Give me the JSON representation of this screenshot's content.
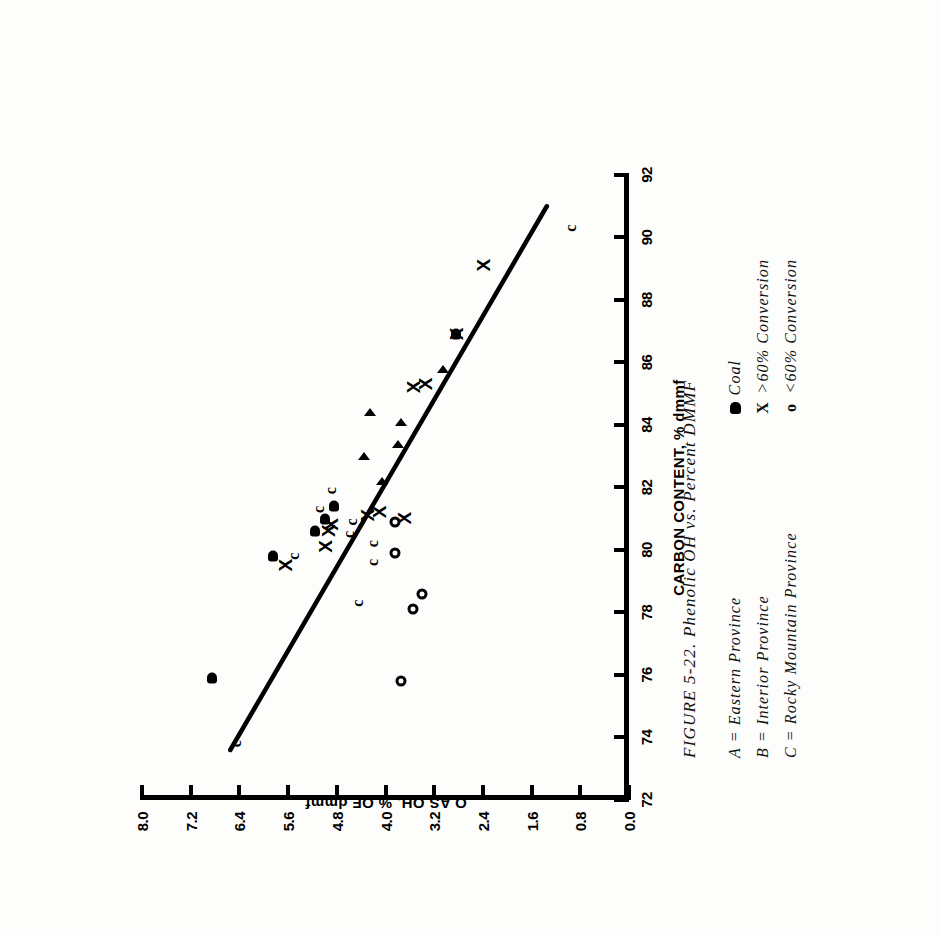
{
  "figure": {
    "caption": "FIGURE 5-22.  Phenolic OH vs. Percent DMMF"
  },
  "legend": {
    "provinces": [
      {
        "key": "A",
        "text": "A = Eastern Province"
      },
      {
        "key": "B",
        "text": "B = Interior Province"
      },
      {
        "key": "C",
        "text": "C = Rocky Mountain Province"
      }
    ],
    "symbols": [
      {
        "glyph": "blob",
        "text": "Coal"
      },
      {
        "glyph": "X",
        "text": ">60% Conversion"
      },
      {
        "glyph": "o",
        "text": "<60% Conversion"
      }
    ]
  },
  "chart_data": {
    "type": "scatter",
    "title": "Phenolic OH vs. Percent DMMF",
    "xlabel": "CARBON CONTENT, % dmmf",
    "ylabel": "O AS OH, % OF dmmf",
    "xlim": [
      72,
      92
    ],
    "ylim": [
      0.0,
      8.0
    ],
    "xticks": [
      72,
      74,
      76,
      78,
      80,
      82,
      84,
      86,
      88,
      90,
      92
    ],
    "xticklabels": [
      "72",
      "74",
      "76",
      "78",
      "80",
      "82",
      "84",
      "86",
      "88",
      "90",
      "92"
    ],
    "yticks": [
      0.0,
      0.8,
      1.6,
      2.4,
      3.2,
      4.0,
      4.8,
      5.6,
      6.4,
      7.2,
      8.0
    ],
    "yticklabels": [
      "0.0",
      "0.8",
      "1.6",
      "2.4",
      "3.2",
      "4.0",
      "4.8",
      "5.6",
      "6.4",
      "7.2",
      "8.0"
    ],
    "grid": false,
    "legend_position": "below-right",
    "trendline": {
      "label": "regression line",
      "x": [
        73.6,
        91.0
      ],
      "y": [
        6.55,
        1.35
      ]
    },
    "series": [
      {
        "name": "Coal",
        "marker": "blob",
        "points": [
          {
            "x": 75.9,
            "y": 6.85
          },
          {
            "x": 79.8,
            "y": 5.85
          },
          {
            "x": 80.6,
            "y": 5.15
          },
          {
            "x": 81.0,
            "y": 5.0
          },
          {
            "x": 81.4,
            "y": 4.85
          },
          {
            "x": 86.9,
            "y": 2.85
          }
        ]
      },
      {
        "name": ">60% Conversion",
        "marker": "X",
        "points": [
          {
            "x": 79.5,
            "y": 5.65
          },
          {
            "x": 80.1,
            "y": 5.0
          },
          {
            "x": 80.6,
            "y": 4.95
          },
          {
            "x": 80.8,
            "y": 4.9
          },
          {
            "x": 81.1,
            "y": 4.3
          },
          {
            "x": 81.2,
            "y": 4.1
          },
          {
            "x": 81.0,
            "y": 3.7
          },
          {
            "x": 85.2,
            "y": 3.55
          },
          {
            "x": 85.3,
            "y": 3.35
          },
          {
            "x": 86.9,
            "y": 2.85
          },
          {
            "x": 89.1,
            "y": 2.4
          }
        ]
      },
      {
        "name": "<60% Conversion",
        "marker": "o",
        "points": [
          {
            "x": 75.8,
            "y": 3.75
          },
          {
            "x": 78.1,
            "y": 3.55
          },
          {
            "x": 78.6,
            "y": 3.4
          },
          {
            "x": 79.9,
            "y": 3.85
          },
          {
            "x": 80.9,
            "y": 3.85
          }
        ]
      },
      {
        "name": "Eastern Province",
        "marker": "A",
        "points": [
          {
            "x": 82.2,
            "y": 4.05
          },
          {
            "x": 83.0,
            "y": 4.35
          },
          {
            "x": 83.4,
            "y": 3.8
          },
          {
            "x": 84.1,
            "y": 3.75
          },
          {
            "x": 84.4,
            "y": 4.25
          },
          {
            "x": 85.8,
            "y": 3.05
          }
        ]
      },
      {
        "name": "Rocky Mountain Province",
        "marker": "C",
        "points": [
          {
            "x": 73.8,
            "y": 6.45
          },
          {
            "x": 78.3,
            "y": 4.45
          },
          {
            "x": 79.8,
            "y": 5.5
          },
          {
            "x": 79.6,
            "y": 4.2
          },
          {
            "x": 80.2,
            "y": 4.2
          },
          {
            "x": 80.5,
            "y": 4.6
          },
          {
            "x": 80.9,
            "y": 4.55
          },
          {
            "x": 81.3,
            "y": 5.1
          },
          {
            "x": 81.9,
            "y": 4.9
          },
          {
            "x": 90.3,
            "y": 0.95
          }
        ]
      }
    ]
  }
}
